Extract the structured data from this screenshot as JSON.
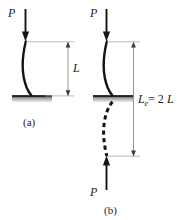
{
  "figure": {
    "title_semantic": "column-effective-length-buckling-diagram",
    "background_color": "#ffffff",
    "ink_color": "#141414",
    "dimension_color": "#8a8a8a",
    "support_color": "#b0b0b0",
    "panels": [
      {
        "id": "a",
        "caption": "(a)",
        "load_label": "P",
        "load_direction": "down",
        "dimension_label": "L",
        "description": "cantilever column fixed at base, buckled shape, length L"
      },
      {
        "id": "b",
        "caption": "(b)",
        "load_label_top": "P",
        "load_label_bottom": "P",
        "load_direction_top": "down",
        "load_direction_bottom": "up",
        "dimension_label_main": "L",
        "dimension_label_sub": "e",
        "dimension_label_equals": " = 2",
        "dimension_label_value": "L",
        "dimension_label_full": "Le = 2L",
        "description": "cantilever column with mirrored dashed image below support giving effective length twice L"
      }
    ]
  }
}
